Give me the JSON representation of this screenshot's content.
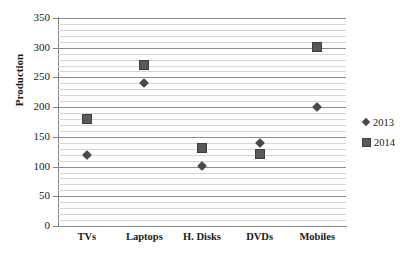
{
  "chart_data": {
    "type": "scatter",
    "title": "",
    "xlabel": "",
    "ylabel": "Production",
    "categories": [
      "TVs",
      "Laptops",
      "H. Disks",
      "DVDs",
      "Mobiles"
    ],
    "series": [
      {
        "name": "2013",
        "marker": "diamond",
        "color": "#4a4a4a",
        "values": [
          120,
          240,
          101,
          140,
          200
        ]
      },
      {
        "name": "2014",
        "marker": "square",
        "color": "#595959",
        "values": [
          180,
          271,
          132,
          121,
          302
        ]
      }
    ],
    "ylim": [
      0,
      350
    ],
    "y_major_step": 50,
    "y_minor_step": 10,
    "y_ticks": [
      0,
      50,
      100,
      150,
      200,
      250,
      300,
      350
    ],
    "y_tick_labels": [
      "0",
      "50",
      "100",
      "150",
      "200",
      "250",
      "300",
      "350"
    ],
    "grid": true,
    "grid_axis": "y",
    "legend": true,
    "legend_position": "right",
    "legend_entries": [
      "2013",
      "2014"
    ]
  },
  "colors": {
    "major_gridline": "#8c8c8c",
    "minor_gridline": "#d6d6d6",
    "axis": "#808080",
    "text": "#1a1a1a",
    "series_2013": "#4a4a4a",
    "series_2014": "#595959",
    "background": "#ffffff"
  }
}
